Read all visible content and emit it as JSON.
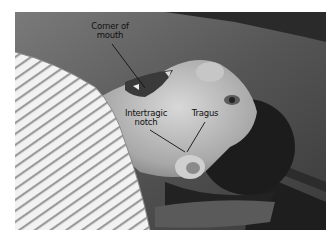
{
  "figure": {
    "labels": {
      "corner_of_mouth": {
        "line1": "Corner of",
        "line2": "mouth"
      },
      "intertragic_notch": {
        "line1": "Intertragic",
        "line2": "notch"
      },
      "tragus": {
        "text": "Tragus"
      }
    }
  }
}
